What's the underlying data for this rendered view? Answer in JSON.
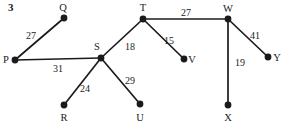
{
  "figure": {
    "number": "3",
    "width": 290,
    "height": 130,
    "background_color": "#ffffff",
    "ink_color": "#1b1b1b"
  },
  "chart_data": {
    "type": "diagram",
    "subtype": "weighted-undirected-graph",
    "title": "3",
    "xlabel": "",
    "ylabel": "",
    "node_radius": 3.4,
    "edge_width": 1.7,
    "nodes": [
      {
        "id": "P",
        "label": "P",
        "x": 15,
        "y": 60,
        "label_x": 6,
        "label_y": 60
      },
      {
        "id": "Q",
        "label": "Q",
        "x": 64,
        "y": 18,
        "label_x": 63,
        "label_y": 8
      },
      {
        "id": "R",
        "label": "R",
        "x": 64,
        "y": 105,
        "label_x": 64,
        "label_y": 118
      },
      {
        "id": "S",
        "label": "S",
        "x": 101,
        "y": 58,
        "label_x": 97,
        "label_y": 47
      },
      {
        "id": "T",
        "label": "T",
        "x": 143,
        "y": 19,
        "label_x": 143,
        "label_y": 8
      },
      {
        "id": "U",
        "label": "U",
        "x": 140,
        "y": 104,
        "label_x": 140,
        "label_y": 118
      },
      {
        "id": "V",
        "label": "V",
        "x": 184,
        "y": 59,
        "label_x": 192,
        "label_y": 60
      },
      {
        "id": "W",
        "label": "W",
        "x": 228,
        "y": 19,
        "label_x": 228,
        "label_y": 9
      },
      {
        "id": "X",
        "label": "X",
        "x": 228,
        "y": 105,
        "label_x": 228,
        "label_y": 118
      },
      {
        "id": "Y",
        "label": "Y",
        "x": 268,
        "y": 57,
        "label_x": 277,
        "label_y": 58
      }
    ],
    "edges": [
      {
        "from": "P",
        "to": "Q",
        "weight": 27,
        "label": "27",
        "label_x": 31,
        "label_y": 36
      },
      {
        "from": "P",
        "to": "S",
        "weight": 31,
        "label": "31",
        "label_x": 58,
        "label_y": 69
      },
      {
        "from": "S",
        "to": "R",
        "weight": 24,
        "label": "24",
        "label_x": 85,
        "label_y": 89
      },
      {
        "from": "S",
        "to": "U",
        "weight": 29,
        "label": "29",
        "label_x": 130,
        "label_y": 81
      },
      {
        "from": "S",
        "to": "T",
        "weight": 18,
        "label": "18",
        "label_x": 130,
        "label_y": 47
      },
      {
        "from": "T",
        "to": "V",
        "weight": 15,
        "label": "15",
        "label_x": 169,
        "label_y": 41
      },
      {
        "from": "T",
        "to": "W",
        "weight": 27,
        "label": "27",
        "label_x": 186,
        "label_y": 13
      },
      {
        "from": "W",
        "to": "X",
        "weight": 19,
        "label": "19",
        "label_x": 240,
        "label_y": 63
      },
      {
        "from": "W",
        "to": "Y",
        "weight": 41,
        "label": "41",
        "label_x": 255,
        "label_y": 36
      }
    ]
  }
}
